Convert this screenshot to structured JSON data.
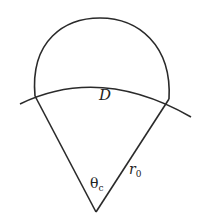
{
  "diagram": {
    "labels": {
      "region": "D",
      "angle": "θ",
      "angle_sub": "c",
      "radius": "r",
      "radius_sub": "0"
    },
    "colors": {
      "stroke": "#2a2a2a",
      "background": "#ffffff"
    }
  }
}
